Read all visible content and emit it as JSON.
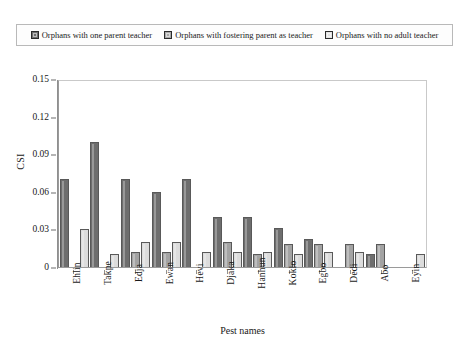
{
  "chart_data": {
    "type": "bar",
    "title": "",
    "xlabel": "Pest names",
    "ylabel": "CSI",
    "categories": [
      "Ehlin",
      "Takpe",
      "Edja",
      "Ewan",
      "Hevi",
      "Djaka",
      "Hanhun",
      "Koklo",
      "Egbo",
      "Dedi",
      "Abo",
      "Eyin"
    ],
    "series": [
      {
        "name": "Orphans with one parent teacher",
        "color": "#6e6e6e",
        "values": [
          0.07,
          0.1,
          0.07,
          0.06,
          0.07,
          0.04,
          0.04,
          0.031,
          0.022,
          0.0,
          0.01,
          0.0
        ]
      },
      {
        "name": "Orphans with fostering parent as teacher",
        "color": "#a3a3a3",
        "values": [
          0.0,
          0.0,
          0.012,
          0.012,
          0.0,
          0.02,
          0.01,
          0.018,
          0.018,
          0.018,
          0.018,
          0.0
        ]
      },
      {
        "name": "Orphans with no adult teacher",
        "color": "#dcdcdc",
        "values": [
          0.03,
          0.01,
          0.02,
          0.02,
          0.012,
          0.012,
          0.012,
          0.01,
          0.012,
          0.012,
          0.0,
          0.01
        ]
      }
    ],
    "yticks": [
      "0.15",
      "0.12",
      "0.09",
      "0.06",
      "0.03",
      "0"
    ],
    "ytick_values": [
      0.15,
      0.12,
      0.09,
      0.06,
      0.03,
      0
    ],
    "ylim": [
      0,
      0.15
    ],
    "grid": false,
    "legend_position": "top"
  },
  "legend": {
    "items": [
      {
        "label": "Orphans with one parent teacher",
        "swatch": "series-0-swatch"
      },
      {
        "label": "Orphans with fostering parent as teacher",
        "swatch": "series-1-swatch"
      },
      {
        "label": "Orphans with no adult teacher",
        "swatch": "series-2-swatch"
      }
    ]
  }
}
